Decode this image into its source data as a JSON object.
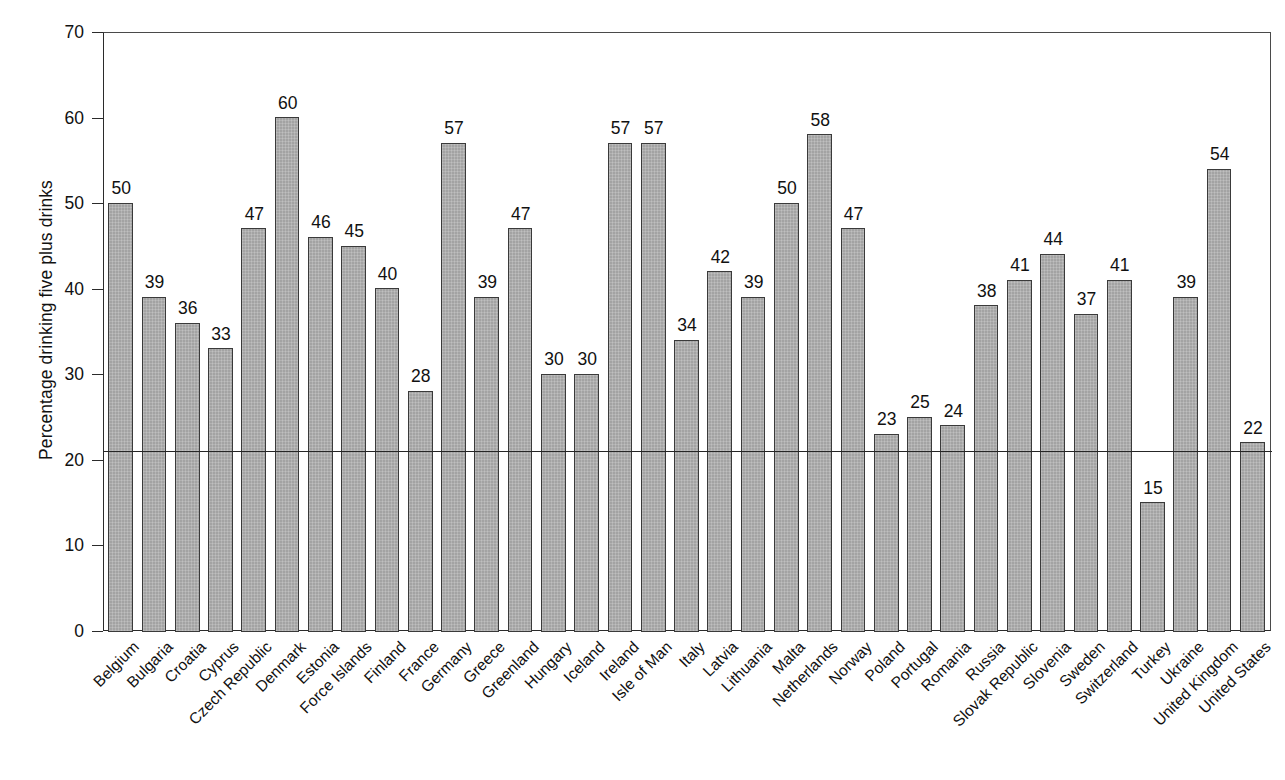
{
  "chart_data": {
    "type": "bar",
    "title": "",
    "xlabel": "",
    "ylabel": "Percentage drinking five plus drinks",
    "ylim": [
      0,
      70
    ],
    "yticks": [
      0,
      10,
      20,
      30,
      40,
      50,
      60,
      70
    ],
    "grid": false,
    "legend": null,
    "reference_line": {
      "value": 21,
      "label": ""
    },
    "bar_color": "#a8a8a8",
    "bar_edge_color": "#3a3a3a",
    "categories": [
      "Belgium",
      "Bulgaria",
      "Croatia",
      "Cyprus",
      "Czech Republic",
      "Denmark",
      "Estonia",
      "Force Islands",
      "Finland",
      "France",
      "Germany",
      "Greece",
      "Greenland",
      "Hungary",
      "Iceland",
      "Ireland",
      "Isle of Man",
      "Italy",
      "Latvia",
      "Lithuania",
      "Malta",
      "Netherlands",
      "Norway",
      "Poland",
      "Portugal",
      "Romania",
      "Russia",
      "Slovak Republic",
      "Slovenia",
      "Sweden",
      "Switzerland",
      "Turkey",
      "Ukraine",
      "United Kingdom",
      "United States"
    ],
    "values": [
      50,
      39,
      36,
      33,
      47,
      60,
      46,
      45,
      40,
      28,
      57,
      39,
      47,
      30,
      30,
      57,
      57,
      34,
      42,
      39,
      50,
      58,
      47,
      23,
      25,
      24,
      38,
      41,
      44,
      37,
      41,
      15,
      39,
      54,
      22
    ],
    "value_labels": [
      "50",
      "39",
      "36",
      "33",
      "47",
      "60",
      "46",
      "45",
      "40",
      "28",
      "57",
      "39",
      "47",
      "30",
      "30",
      "57",
      "57",
      "34",
      "42",
      "39",
      "50",
      "58",
      "47",
      "23",
      "25",
      "24",
      "38",
      "41",
      "44",
      "37",
      "41",
      "15",
      "39",
      "54",
      "22"
    ]
  }
}
